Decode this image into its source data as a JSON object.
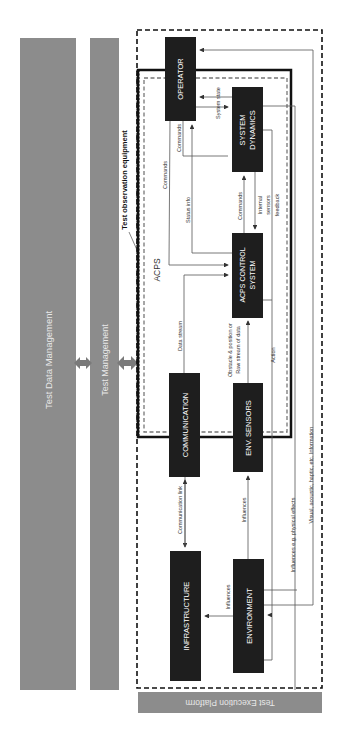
{
  "diagram": {
    "bars": {
      "test_data_management": "Test Data Management",
      "test_management": "Test Management",
      "test_execution_platform": "Test Execution Platform"
    },
    "regions": {
      "test_observation_equipment": "Test observation equipment",
      "acps": "ACPS"
    },
    "blocks": {
      "operator": "OPERATOR",
      "system_dynamics_1": "SYSTEM",
      "system_dynamics_2": "DYNAMICS",
      "acps_control_1": "ACPS CONTROL",
      "acps_control_2": "SYSTEM",
      "communication": "COMMUNICATION",
      "env_sensors": "ENV. SENSORS",
      "infrastructure": "INFRASTRUCTURE",
      "environment": "ENVIRONMENT"
    },
    "edges": {
      "system_state": "System state",
      "commands_op_sd": "Commands",
      "commands_op_acps": "Commands",
      "status_info": "Status info",
      "commands_acps_sd": "Commands",
      "internal_sensors_1": "Internal",
      "internal_sensors_2": "sensors",
      "internal_sensors_3": "feedback",
      "data_stream": "Data stream",
      "obstacle_1": "Obstacle & position or",
      "obstacle_2": "Raw stream of data",
      "action": "Action",
      "visual_info": "Visual, acoustic, haptic, etc. Information",
      "communication_link": "Communication link",
      "influences_env_sensors": "Influences",
      "influences_physical": "Influences e.g. physical effects",
      "influences_infra": "Influences"
    },
    "colors": {
      "bar_gray": "#8c8c8c",
      "block_fill": "#1e1e1e",
      "block_text": "#ffffff",
      "line": "#555555",
      "frame": "#111111"
    }
  }
}
